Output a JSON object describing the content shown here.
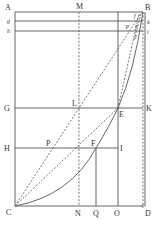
{
  "diagram": {
    "colors": {
      "line": "#555555",
      "text": "#333333",
      "background": "#ffffff"
    },
    "labels": {
      "A": "A",
      "M": "M",
      "B": "B",
      "g": "g",
      "h": "h",
      "k": "k",
      "i": "i",
      "f": "f",
      "p": "p",
      "e": "e",
      "l": "l",
      "G": "G",
      "L": "L",
      "E": "E",
      "K": "K",
      "H": "H",
      "P": "P",
      "F": "F",
      "I": "I",
      "C": "C",
      "N": "N",
      "Q": "Q",
      "O": "O",
      "D": "D"
    }
  }
}
